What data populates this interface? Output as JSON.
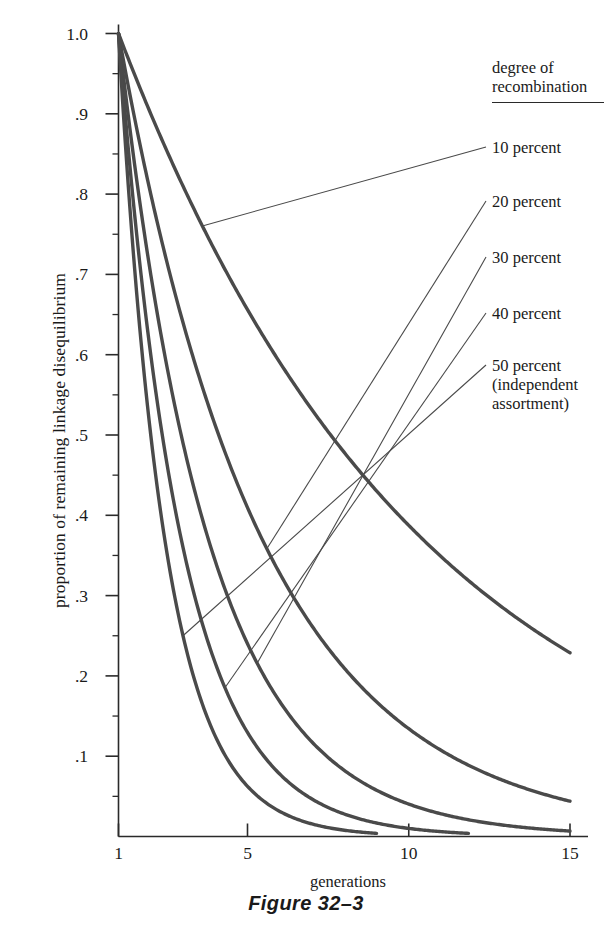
{
  "chart_data": {
    "type": "line",
    "title": "",
    "caption": "Figure 32–3",
    "xlabel": "generations",
    "ylabel": "proportion of remaining linkage disequilibrium",
    "xlim": [
      1,
      15.6
    ],
    "ylim": [
      0,
      1.0
    ],
    "grid": false,
    "legend_position": "right",
    "legend_title": "degree of\nrecombination",
    "x_ticks": [
      1,
      5,
      10,
      15
    ],
    "x_tick_labels": [
      "1",
      "5",
      "10",
      "15"
    ],
    "y_ticks": [
      0.1,
      0.2,
      0.3,
      0.4,
      0.5,
      0.6,
      0.7,
      0.8,
      0.9,
      1.0
    ],
    "y_tick_labels": [
      ".1",
      ".2",
      ".3",
      ".4",
      ".5",
      ".6",
      ".7",
      ".8",
      ".9",
      "1.0"
    ],
    "y_minor_ticks": [
      0.05,
      0.15,
      0.25,
      0.35,
      0.45,
      0.55,
      0.65,
      0.75,
      0.85,
      0.95
    ],
    "x": [
      1,
      2,
      3,
      4,
      5,
      6,
      7,
      8,
      9,
      10,
      11,
      12,
      13,
      14,
      15
    ],
    "series": [
      {
        "name": "10 percent",
        "recombination_rate": 0.1,
        "label": "10 percent",
        "values": [
          1.0,
          0.9,
          0.81,
          0.729,
          0.656,
          0.59,
          0.531,
          0.478,
          0.43,
          0.387,
          0.349,
          0.314,
          0.282,
          0.254,
          0.229
        ]
      },
      {
        "name": "20 percent",
        "recombination_rate": 0.2,
        "label": "20 percent",
        "values": [
          1.0,
          0.8,
          0.64,
          0.512,
          0.41,
          0.328,
          0.262,
          0.21,
          0.168,
          0.134,
          0.107,
          0.086,
          0.069,
          0.055,
          0.044
        ]
      },
      {
        "name": "30 percent",
        "recombination_rate": 0.3,
        "label": "30 percent",
        "values": [
          1.0,
          0.7,
          0.49,
          0.343,
          0.24,
          0.168,
          0.118,
          0.082,
          0.058,
          0.04,
          0.028,
          0.02,
          0.014,
          0.01,
          0.007
        ]
      },
      {
        "name": "40 percent",
        "recombination_rate": 0.4,
        "label": "40 percent",
        "values": [
          1.0,
          0.6,
          0.36,
          0.216,
          0.13,
          0.078,
          0.047,
          0.028,
          0.017,
          0.01,
          0.006,
          0.004,
          0.002,
          0.001,
          0.001
        ]
      },
      {
        "name": "50 percent (independent assortment)",
        "recombination_rate": 0.5,
        "label": "50 percent\n(independent\nassortment)",
        "values": [
          1.0,
          0.5,
          0.25,
          0.125,
          0.063,
          0.031,
          0.016,
          0.008,
          0.004,
          0.002,
          0.001,
          0.0,
          0.0,
          0.0,
          0.0
        ]
      }
    ]
  },
  "legend": {
    "title": "degree of\nrecombination",
    "entries": [
      {
        "label": "10 percent"
      },
      {
        "label": "20 percent"
      },
      {
        "label": "30 percent"
      },
      {
        "label": "40 percent"
      },
      {
        "label": "50 percent\n(independent\nassortment)"
      }
    ]
  },
  "axes": {
    "x_title": "generations",
    "y_title": "proportion of remaining linkage disequilibrium",
    "x_tick_labels": [
      "1",
      "5",
      "10",
      "15"
    ],
    "y_tick_labels": [
      "1.0",
      ".9",
      ".8",
      ".7",
      ".6",
      ".5",
      ".4",
      ".3",
      ".2",
      ".1"
    ]
  },
  "caption": "Figure 32–3",
  "colors": {
    "curve": "#4a4a4a",
    "axis": "#2a2a2a",
    "leader": "#4a4a4a",
    "text": "#1a1a1a",
    "background": "#ffffff"
  }
}
